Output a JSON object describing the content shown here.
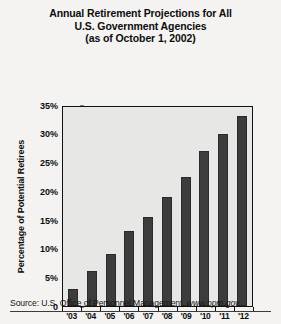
{
  "chart_data": {
    "type": "bar",
    "title": "Annual Retirement Projections for All U.S. Government Agencies (as of October 1, 2002)",
    "title_lines": [
      "Annual Retirement Projections for All",
      "U.S. Government Agencies",
      "(as of October 1, 2002)"
    ],
    "categories": [
      "'03",
      "'04",
      "'05",
      "'06",
      "'07",
      "'08",
      "'09",
      "'10",
      "'11",
      "'12"
    ],
    "values": [
      3,
      6,
      9,
      13,
      15.5,
      19,
      22.5,
      27,
      30,
      33
    ],
    "xlabel": "Years",
    "ylabel": "Percentage of Potential Retirees",
    "ylim": [
      0,
      35
    ],
    "ytick_values": [
      0,
      5,
      10,
      15,
      20,
      25,
      30,
      35
    ],
    "ytick_labels": [
      "0",
      "5%",
      "10%",
      "15%",
      "20%",
      "25%",
      "30%",
      "35%"
    ],
    "grid": false,
    "legend": null,
    "bar_color": "#3c3c3c",
    "plot_background": "#e7e7e5",
    "page_background": "#f4f3f1"
  },
  "source": {
    "prefix": "Source: U.S. Office of Personnel Management, ",
    "url": "www.opm.gov."
  }
}
